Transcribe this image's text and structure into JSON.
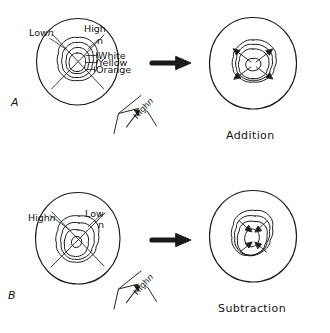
{
  "figure": {
    "type": "hand-drawn-schematic",
    "stroke_color": "#1a1a1a",
    "background_color": "#ffffff"
  },
  "panels": [
    {
      "id": "A",
      "letter": "A",
      "source_labels": {
        "low": "Low",
        "low_symbol": "n",
        "high": "High",
        "high_symbol": "n",
        "fringe_colors": [
          "White",
          "Yellow",
          "Orange"
        ]
      },
      "axis_legend": {
        "label": "High",
        "symbol": "n",
        "arrow_direction": "up-right"
      },
      "operation_arrow": "rightwards-solid-arrow",
      "result_caption": "Addition",
      "result_arrows": 4,
      "result_arrow_direction": "outward-diagonal"
    },
    {
      "id": "B",
      "letter": "B",
      "source_labels": {
        "high": "High",
        "high_symbol": "n",
        "low": "Low",
        "low_symbol": "n"
      },
      "axis_legend": {
        "label": "High",
        "symbol": "n",
        "arrow_direction": "up-right"
      },
      "operation_arrow": "rightwards-solid-arrow",
      "result_caption": "Subtraction",
      "result_arrows": 4,
      "result_arrow_direction": "inward-diagonal"
    }
  ],
  "captions": {
    "addition": "Addition",
    "subtraction": "Subtraction"
  }
}
